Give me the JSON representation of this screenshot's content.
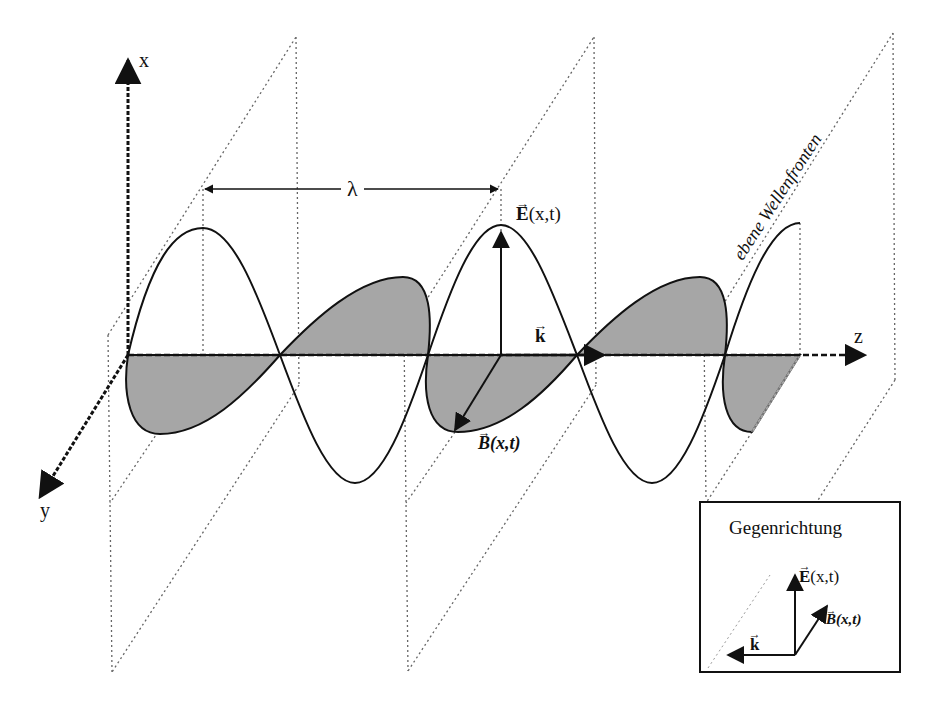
{
  "figure": {
    "axes": {
      "x_label": "x",
      "y_label": "y",
      "z_label": "z"
    },
    "wavelength_label": "λ",
    "wavefront_label": "ebene Wellenfronten",
    "vectors": {
      "E_label_main": "E",
      "E_args": "(x,t)",
      "k_label": "k",
      "B_label_main": "B",
      "B_args": "(x,t)"
    },
    "inset": {
      "title": "Gegenrichtung",
      "E_label_main": "E",
      "E_args": "(x,t)",
      "B_label_main": "B",
      "B_args": "(x,t)",
      "k_label": "k"
    },
    "colors": {
      "ink": "#111111",
      "fill": "#a6a6a6",
      "dotted": "#666666"
    }
  }
}
